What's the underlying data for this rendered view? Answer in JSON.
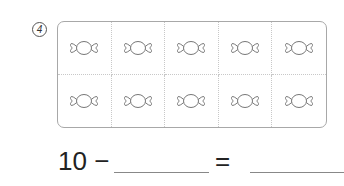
{
  "problem": {
    "number_label": "4",
    "ten_frame": {
      "rows": 2,
      "columns": 5,
      "item_icon": "candy-icon",
      "item_count": 10,
      "border_color": "#a8a8a8",
      "icon_color": "#777777"
    },
    "equation": {
      "lhs": "10 −",
      "operator_equals": "=",
      "blank_1": "",
      "blank_2": ""
    }
  }
}
